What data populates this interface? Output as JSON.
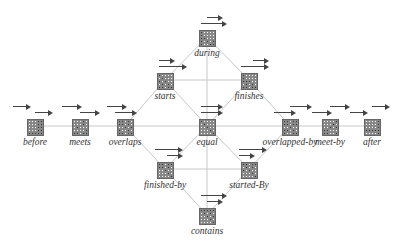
{
  "diagram": {
    "line_color": "#c8c8c8",
    "nodes": [
      {
        "id": "before",
        "label": "before",
        "x": 35,
        "y": 104,
        "a1": [
          0,
          14
        ],
        "a2": [
          22,
          36
        ],
        "grid": [
          "00011",
          "00011",
          "00011",
          "00011",
          "11111"
        ]
      },
      {
        "id": "meets",
        "label": "meets",
        "x": 80,
        "y": 104,
        "a1": [
          4,
          20
        ],
        "a2": [
          22,
          38
        ],
        "grid": [
          "00010",
          "00010",
          "01000",
          "00001",
          "11011"
        ]
      },
      {
        "id": "overlaps",
        "label": "overlaps",
        "x": 125,
        "y": 104,
        "a1": [
          4,
          20
        ],
        "a2": [
          12,
          30
        ],
        "grid": [
          "11010",
          "11010",
          "00101",
          "10010",
          "11011"
        ]
      },
      {
        "id": "equal",
        "label": "equal",
        "x": 207,
        "y": 104,
        "a1": [
          16,
          34
        ],
        "a2": [
          16,
          34
        ],
        "grid": [
          "10000",
          "01000",
          "00100",
          "00010",
          "00001"
        ]
      },
      {
        "id": "overlapped-by",
        "label": "overlapped-by",
        "x": 290,
        "y": 104,
        "a1": [
          22,
          40
        ],
        "a2": [
          6,
          24
        ],
        "grid": [
          "11011",
          "11011",
          "00100",
          "11010",
          "10011"
        ]
      },
      {
        "id": "meet-by",
        "label": "meet-by",
        "x": 330,
        "y": 104,
        "a1": [
          22,
          38
        ],
        "a2": [
          4,
          20
        ],
        "grid": [
          "00001",
          "00010",
          "00101",
          "11000",
          "11001"
        ]
      },
      {
        "id": "after",
        "label": "after",
        "x": 372,
        "y": 104,
        "a1": [
          22,
          36
        ],
        "a2": [
          0,
          14
        ],
        "grid": [
          "00001",
          "00001",
          "00001",
          "11111",
          "00001"
        ]
      },
      {
        "id": "during",
        "label": "during",
        "x": 207,
        "y": 15,
        "a1": [
          22,
          34
        ],
        "a2": [
          16,
          38
        ],
        "grid": [
          "10000",
          "10000",
          "11000",
          "10101",
          "10011"
        ]
      },
      {
        "id": "starts",
        "label": "starts",
        "x": 165,
        "y": 58,
        "a1": [
          16,
          28
        ],
        "a2": [
          16,
          40
        ],
        "grid": [
          "10000",
          "01000",
          "10100",
          "01010",
          "11011"
        ]
      },
      {
        "id": "finishes",
        "label": "finishes",
        "x": 249,
        "y": 58,
        "a1": [
          26,
          38
        ],
        "a2": [
          14,
          38
        ],
        "grid": [
          "10000",
          "10000",
          "11100",
          "01010",
          "11011"
        ]
      },
      {
        "id": "finished-by",
        "label": "finished-by",
        "x": 165,
        "y": 147,
        "a1": [
          12,
          36
        ],
        "a2": [
          24,
          36
        ],
        "grid": [
          "11011",
          "11010",
          "00100",
          "00010",
          "00001"
        ]
      },
      {
        "id": "started-By",
        "label": "started-By",
        "x": 249,
        "y": 147,
        "a1": [
          12,
          36
        ],
        "a2": [
          12,
          24
        ],
        "grid": [
          "11011",
          "01010",
          "10100",
          "00010",
          "00001"
        ]
      },
      {
        "id": "contains",
        "label": "contains",
        "x": 207,
        "y": 193,
        "a1": [
          16,
          38
        ],
        "a2": [
          22,
          34
        ],
        "grid": [
          "11111",
          "01010",
          "00101",
          "00010",
          "00001"
        ]
      }
    ],
    "edges": [
      [
        "before",
        "meets"
      ],
      [
        "meets",
        "overlaps"
      ],
      [
        "overlaps",
        "equal"
      ],
      [
        "equal",
        "overlapped-by"
      ],
      [
        "overlapped-by",
        "meet-by"
      ],
      [
        "meet-by",
        "after"
      ],
      [
        "overlaps",
        "starts"
      ],
      [
        "starts",
        "during"
      ],
      [
        "during",
        "finishes"
      ],
      [
        "finishes",
        "overlapped-by"
      ],
      [
        "overlaps",
        "finished-by"
      ],
      [
        "finished-by",
        "contains"
      ],
      [
        "contains",
        "started-By"
      ],
      [
        "started-By",
        "overlapped-by"
      ],
      [
        "starts",
        "equal"
      ],
      [
        "equal",
        "finishes"
      ],
      [
        "finished-by",
        "equal"
      ],
      [
        "equal",
        "started-By"
      ],
      [
        "starts",
        "finishes"
      ],
      [
        "finished-by",
        "started-By"
      ],
      [
        "during",
        "contains"
      ]
    ]
  }
}
